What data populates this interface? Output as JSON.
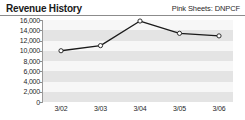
{
  "header": {
    "title": "Revenue History",
    "ticker": "Pink Sheets: DNPCF"
  },
  "colors": {
    "header_text": "#1a1a1a",
    "ticker_text": "#2b2b2b",
    "rule": "#8c8c8c",
    "band_dark": "#e4e4e4",
    "band_light": "#f7f7f7",
    "line": "#1a1a1a",
    "marker_fill": "#ffffff",
    "marker_stroke": "#1a1a1a",
    "axis": "#9a9a9a"
  },
  "chart_data": {
    "type": "line",
    "title": "Revenue History",
    "xlabel": "",
    "ylabel": "",
    "categories": [
      "3/02",
      "3/03",
      "3/04",
      "3/05",
      "3/06"
    ],
    "values": [
      10000,
      11000,
      15800,
      13400,
      12900
    ],
    "series": [
      {
        "name": "Revenue",
        "values": [
          10000,
          11000,
          15800,
          13400,
          12900
        ]
      }
    ],
    "ylim": [
      0,
      16000
    ],
    "yticks": [
      16000,
      14000,
      12000,
      10000,
      8000,
      6000,
      4000,
      2000,
      0
    ],
    "ytick_labels": [
      "16,000",
      "14,000",
      "12,000",
      "10,000",
      "8,000",
      "6,000",
      "4,000",
      "2,000",
      "0"
    ],
    "grid": "horizontal-bands",
    "legend": "none",
    "marker": "open-circle"
  }
}
